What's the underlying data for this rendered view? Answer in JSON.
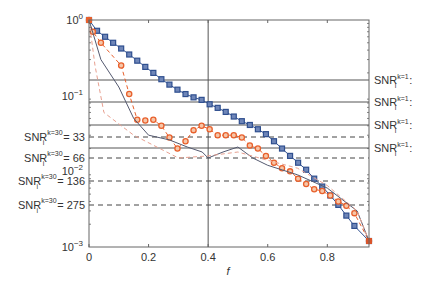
{
  "chart_data": {
    "type": "line",
    "title": "",
    "xlabel": "f",
    "ylabel": "",
    "yscale": "log",
    "xlim": [
      0,
      0.94
    ],
    "ylim": [
      0.001,
      1
    ],
    "x_ticks": [
      {
        "value": 0,
        "label": "0"
      },
      {
        "value": 0.2,
        "label": "0.2"
      },
      {
        "value": 0.4,
        "label": "0.4"
      },
      {
        "value": 0.6,
        "label": "0.6"
      },
      {
        "value": 0.8,
        "label": "0.8"
      }
    ],
    "y_ticks": [
      {
        "value": 1,
        "base": "10",
        "exp": "0"
      },
      {
        "value": 0.1,
        "base": "10",
        "exp": "−1"
      },
      {
        "value": 0.01,
        "base": "10",
        "exp": "−2"
      },
      {
        "value": 0.001,
        "base": "10",
        "exp": "−3"
      }
    ],
    "vertical_reference": {
      "x": 0.4
    },
    "left_reference_lines": [
      {
        "label": "SNR",
        "sup": "k=30",
        "sub": "i",
        "suffix": "= 33",
        "style": "dashed",
        "y_px": 137
      },
      {
        "label": "SNR",
        "sup": "k=30",
        "sub": "i",
        "suffix": "= 66",
        "style": "dashed",
        "y_px": 158
      },
      {
        "label": "SNR",
        "sup": "k=30",
        "sub": "i",
        "suffix": "= 136",
        "style": "dashed",
        "y_px": 181
      },
      {
        "label": "SNR",
        "sup": "k=30",
        "sub": "i",
        "suffix": "= 275",
        "style": "dashed",
        "y_px": 205
      }
    ],
    "right_reference_lines": [
      {
        "label": "SNR",
        "sup": "k=1",
        "sub": "i",
        "suffix": ":",
        "style": "solid",
        "y_px": 80
      },
      {
        "label": "SNR",
        "sup": "k=1",
        "sub": "i",
        "suffix": ":",
        "style": "solid",
        "y_px": 102
      },
      {
        "label": "SNR",
        "sup": "k=1",
        "sub": "i",
        "suffix": ":",
        "style": "solid",
        "y_px": 125
      },
      {
        "label": "SNR",
        "sup": "k=1",
        "sub": "i",
        "suffix": ":",
        "style": "solid",
        "y_px": 148
      }
    ],
    "series": [
      {
        "name": "blue squares",
        "color": "#2f4f8f",
        "marker": "square",
        "x": [
          0,
          0.027,
          0.054,
          0.081,
          0.108,
          0.135,
          0.162,
          0.189,
          0.216,
          0.243,
          0.27,
          0.297,
          0.324,
          0.351,
          0.378,
          0.405,
          0.432,
          0.459,
          0.486,
          0.513,
          0.54,
          0.567,
          0.594,
          0.621,
          0.648,
          0.675,
          0.702,
          0.729,
          0.756,
          0.783,
          0.81,
          0.837,
          0.864,
          0.891,
          0.94
        ],
        "y": [
          1.0,
          0.72,
          0.6,
          0.5,
          0.42,
          0.35,
          0.29,
          0.24,
          0.2,
          0.165,
          0.14,
          0.12,
          0.105,
          0.095,
          0.088,
          0.077,
          0.069,
          0.061,
          0.053,
          0.046,
          0.041,
          0.036,
          0.031,
          0.025,
          0.02,
          0.016,
          0.013,
          0.0105,
          0.008,
          0.0063,
          0.0048,
          0.0036,
          0.0026,
          0.0019,
          0.0012
        ]
      },
      {
        "name": "orange circles",
        "color": "#e8602c",
        "marker": "circle",
        "style": "dashed",
        "x": [
          0,
          0.013,
          0.04,
          0.108,
          0.135,
          0.162,
          0.189,
          0.216,
          0.243,
          0.27,
          0.297,
          0.324,
          0.351,
          0.378,
          0.405,
          0.432,
          0.459,
          0.486,
          0.513,
          0.54,
          0.567,
          0.594,
          0.621,
          0.648,
          0.675,
          0.702,
          0.729,
          0.756,
          0.783,
          0.81,
          0.837,
          0.864,
          0.891,
          0.94
        ],
        "y": [
          1.0,
          0.7,
          0.5,
          0.25,
          0.105,
          0.048,
          0.047,
          0.048,
          0.04,
          0.028,
          0.02,
          0.025,
          0.035,
          0.04,
          0.036,
          0.03,
          0.03,
          0.03,
          0.028,
          0.022,
          0.02,
          0.016,
          0.013,
          0.011,
          0.01,
          0.008,
          0.0068,
          0.0058,
          0.0055,
          0.0048,
          0.004,
          0.0035,
          0.0028,
          0.0012
        ]
      },
      {
        "name": "gray solid",
        "color": "#555a70",
        "style": "solid",
        "x": [
          0,
          0.04,
          0.1,
          0.15,
          0.2,
          0.27,
          0.33,
          0.38,
          0.4,
          0.45,
          0.5,
          0.55,
          0.6,
          0.7,
          0.8,
          0.9,
          0.94
        ],
        "y": [
          1.0,
          0.3,
          0.13,
          0.05,
          0.03,
          0.026,
          0.021,
          0.018,
          0.015,
          0.018,
          0.021,
          0.015,
          0.012,
          0.009,
          0.006,
          0.003,
          0.0012
        ]
      },
      {
        "name": "pink dashed",
        "color": "#e8a090",
        "style": "dashed",
        "x": [
          0,
          0.02,
          0.05,
          0.15,
          0.3,
          0.4,
          0.5,
          0.6,
          0.7,
          0.8,
          0.9,
          0.94
        ],
        "y": [
          1.0,
          0.25,
          0.06,
          0.03,
          0.015,
          0.016,
          0.018,
          0.014,
          0.011,
          0.0065,
          0.003,
          0.0012
        ]
      }
    ]
  }
}
